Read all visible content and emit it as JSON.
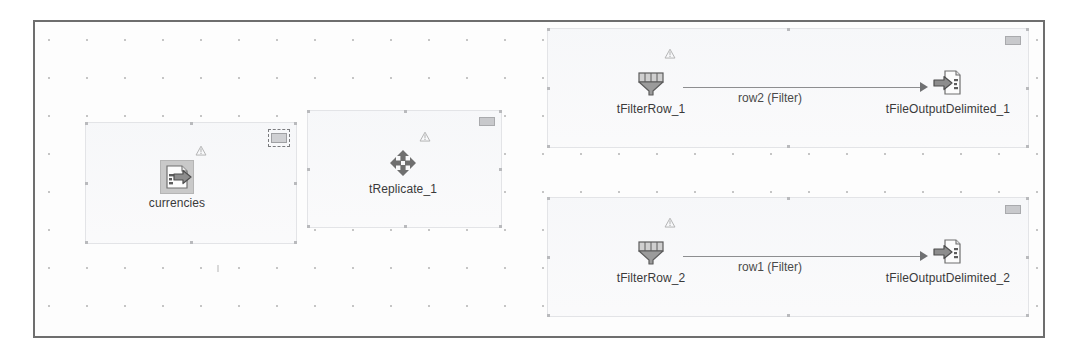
{
  "editor": {
    "name": "talend-job-designer-canvas",
    "background_color": "#fdfdfd",
    "border_color": "#6e6e6e",
    "grid": "dots"
  },
  "subjobs": [
    {
      "id": "subjob-currencies",
      "collapse_widget": "collapse-widget-selected",
      "components": [
        {
          "name": "currencies",
          "label": "currencies",
          "icon": "file-input-icon",
          "selected": true,
          "badge": "warning-badge"
        }
      ],
      "connections": []
    },
    {
      "id": "subjob-treplicate",
      "collapse_widget": "collapse-widget",
      "components": [
        {
          "name": "tReplicate_1",
          "label": "tReplicate_1",
          "icon": "replicate-arrows-icon",
          "selected": false,
          "badge": "warning-badge"
        }
      ],
      "connections": []
    },
    {
      "id": "subjob-filter-row-1",
      "collapse_widget": "collapse-widget",
      "components": [
        {
          "name": "tFilterRow_1",
          "label": "tFilterRow_1",
          "icon": "funnel-filter-icon",
          "selected": false,
          "badge": "warning-badge"
        },
        {
          "name": "tFileOutputDelimited_1",
          "label": "tFileOutputDelimited_1",
          "icon": "file-output-icon",
          "selected": false,
          "badge": null
        }
      ],
      "connections": [
        {
          "label": "row2 (Filter)",
          "from": "tFilterRow_1",
          "to": "tFileOutputDelimited_1"
        }
      ]
    },
    {
      "id": "subjob-filter-row-2",
      "collapse_widget": "collapse-widget",
      "components": [
        {
          "name": "tFilterRow_2",
          "label": "tFilterRow_2",
          "icon": "funnel-filter-icon",
          "selected": false,
          "badge": "warning-badge"
        },
        {
          "name": "tFileOutputDelimited_2",
          "label": "tFileOutputDelimited_2",
          "icon": "file-output-icon",
          "selected": false,
          "badge": null
        }
      ],
      "connections": [
        {
          "label": "row1 (Filter)",
          "from": "tFilterRow_2",
          "to": "tFileOutputDelimited_2"
        }
      ]
    }
  ],
  "labels": {
    "currencies": "currencies",
    "tReplicate_1": "tReplicate_1",
    "tFilterRow_1": "tFilterRow_1",
    "tFilterRow_2": "tFilterRow_2",
    "tFileOutputDelimited_1": "tFileOutputDelimited_1",
    "tFileOutputDelimited_2": "tFileOutputDelimited_2",
    "row2": "row2 (Filter)",
    "row1": "row1 (Filter)"
  },
  "colors": {
    "frame_border": "#6e6e6e",
    "subjob_border": "#e3e4e7",
    "connection_line": "#8d8e90",
    "text": "#3a3a3a",
    "selection_fill": "#c9c9c9"
  }
}
